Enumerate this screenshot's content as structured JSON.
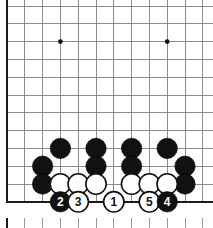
{
  "diagram": {
    "board": {
      "origin_x": 7,
      "origin_y": 6,
      "spacing": 17.8,
      "cols": 12,
      "rows": 12,
      "left_edge": true,
      "bottom_edge": true,
      "line_color": "#8c8c8c",
      "edge_color": "#1a1a1a",
      "background_color": "#ffffff"
    },
    "star_points": [
      {
        "name": "star-point-left",
        "col": 3,
        "row": 2
      },
      {
        "name": "star-point-right",
        "col": 9,
        "row": 2
      }
    ],
    "stones": [
      {
        "name": "black-stone-c4",
        "color": "black",
        "col": 2,
        "row": 9
      },
      {
        "name": "black-stone-d5",
        "color": "black",
        "col": 3,
        "row": 8
      },
      {
        "name": "black-stone-c3",
        "color": "black",
        "col": 2,
        "row": 10
      },
      {
        "name": "black-stone-f5",
        "color": "black",
        "col": 5,
        "row": 8
      },
      {
        "name": "black-stone-f4",
        "color": "black",
        "col": 5,
        "row": 9
      },
      {
        "name": "black-stone-h5",
        "color": "black",
        "col": 7,
        "row": 8
      },
      {
        "name": "black-stone-h4",
        "color": "black",
        "col": 7,
        "row": 9
      },
      {
        "name": "black-stone-j5",
        "color": "black",
        "col": 9,
        "row": 8
      },
      {
        "name": "black-stone-k4",
        "color": "black",
        "col": 10,
        "row": 9
      },
      {
        "name": "black-stone-k3",
        "color": "black",
        "col": 10,
        "row": 10
      },
      {
        "name": "white-stone-d3",
        "color": "white",
        "col": 3,
        "row": 10
      },
      {
        "name": "white-stone-e3",
        "color": "white",
        "col": 4,
        "row": 10
      },
      {
        "name": "white-stone-f3",
        "color": "white",
        "col": 5,
        "row": 10
      },
      {
        "name": "white-stone-h3",
        "color": "white",
        "col": 7,
        "row": 10
      },
      {
        "name": "white-stone-j3",
        "color": "white",
        "col": 8,
        "row": 10
      },
      {
        "name": "white-stone-k3b",
        "color": "white",
        "col": 9,
        "row": 10
      }
    ],
    "numbered_moves": [
      {
        "name": "move-stone-2",
        "label": "2",
        "color": "black",
        "col": 3,
        "row": 11
      },
      {
        "name": "move-stone-3",
        "label": "3",
        "color": "white",
        "col": 4,
        "row": 11
      },
      {
        "name": "move-stone-1",
        "label": "1",
        "color": "white",
        "col": 6,
        "row": 11
      },
      {
        "name": "move-stone-5",
        "label": "5",
        "color": "white",
        "col": 8,
        "row": 11
      },
      {
        "name": "move-stone-4",
        "label": "4",
        "color": "black",
        "col": 9,
        "row": 11
      }
    ],
    "next_diagram_strip": {
      "name": "next-diagram-top-edge",
      "y": 218,
      "tick_height": 10,
      "cols": 12
    }
  }
}
